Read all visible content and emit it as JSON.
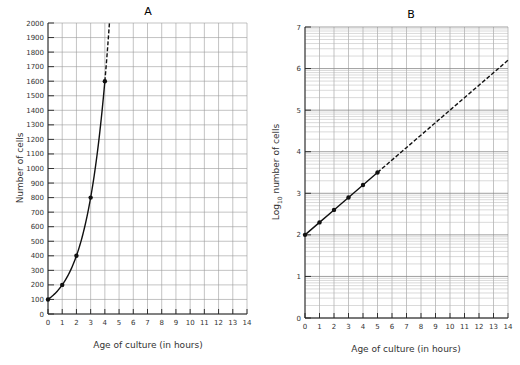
{
  "chart_data": [
    {
      "type": "line",
      "title": "A",
      "xlabel": "Age of culture  (in hours)",
      "ylabel": "Number of cells",
      "xlim": [
        0,
        14
      ],
      "ylim": [
        0,
        2000
      ],
      "grid": true,
      "x_ticks": [
        0,
        1,
        2,
        3,
        4,
        5,
        6,
        7,
        8,
        9,
        10,
        11,
        12,
        13,
        14
      ],
      "y_ticks": [
        0,
        100,
        200,
        300,
        400,
        500,
        600,
        700,
        800,
        900,
        1000,
        1100,
        1200,
        1300,
        1400,
        1500,
        1600,
        1700,
        1800,
        1900,
        2000
      ],
      "series": [
        {
          "name": "observed",
          "style": "solid",
          "markers": true,
          "x": [
            0,
            1,
            2,
            3,
            4
          ],
          "values": [
            100,
            200,
            400,
            800,
            1600
          ]
        },
        {
          "name": "extrapolated",
          "style": "dashed",
          "markers": false,
          "x": [
            4,
            4.3,
            4.6
          ],
          "values": [
            1600,
            1800,
            2000
          ]
        }
      ]
    },
    {
      "type": "line",
      "title": "B",
      "xlabel": "Age of culture  (in hours)",
      "ylabel": "Log10 number of cells",
      "ylabel_parts": {
        "pre": "Log",
        "sub": "10",
        "post": " number  of  cells"
      },
      "xlim": [
        0,
        14
      ],
      "ylim": [
        0,
        7
      ],
      "grid": true,
      "x_ticks": [
        0,
        1,
        2,
        3,
        4,
        5,
        6,
        7,
        8,
        9,
        10,
        11,
        12,
        13,
        14
      ],
      "y_ticks": [
        0,
        1,
        2,
        3,
        4,
        5,
        6,
        7
      ],
      "series": [
        {
          "name": "observed",
          "style": "solid",
          "markers": true,
          "x": [
            0,
            1,
            2,
            3,
            4,
            5
          ],
          "values": [
            2.0,
            2.3,
            2.6,
            2.9,
            3.2,
            3.5
          ]
        },
        {
          "name": "extrapolated",
          "style": "dashed",
          "markers": false,
          "x": [
            5,
            9,
            14
          ],
          "values": [
            3.5,
            4.7,
            6.2
          ]
        }
      ]
    }
  ],
  "panels": {
    "a": {
      "title": "A",
      "ylabel": "Number  of  cells",
      "xlabel": "Age of culture  (in hours)"
    },
    "b": {
      "title": "B",
      "ylabel_pre": "Log",
      "ylabel_sub": "10",
      "ylabel_post": " number  of  cells",
      "xlabel": "Age of culture  (in hours)"
    }
  }
}
